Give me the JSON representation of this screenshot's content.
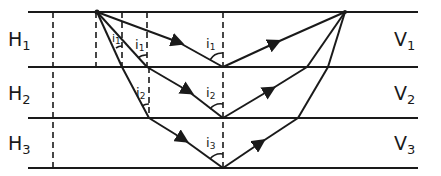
{
  "diagram": {
    "layers": [
      {
        "thickness_label": "H",
        "thickness_sub": "1",
        "velocity_label": "V",
        "velocity_sub": "1"
      },
      {
        "thickness_label": "H",
        "thickness_sub": "2",
        "velocity_label": "V",
        "velocity_sub": "2"
      },
      {
        "thickness_label": "H",
        "thickness_sub": "3",
        "velocity_label": "V",
        "velocity_sub": "3"
      }
    ],
    "angle_labels": [
      {
        "text": "i",
        "sub": "1",
        "note": "incidence angle at reflector 1"
      },
      {
        "text": "i",
        "sub": "2",
        "note": "incidence angle at reflector 2"
      },
      {
        "text": "i",
        "sub": "3",
        "note": "incidence angle at reflector 3"
      },
      {
        "text": "i",
        "sub": "1",
        "note": "refraction angle in layer 1, ray 2"
      },
      {
        "text": "i",
        "sub": "2",
        "note": "refraction angle in layer 2, ray 3"
      },
      {
        "text": "i",
        "sub": "1",
        "note": "refraction angle in layer 1, ray 3"
      }
    ],
    "colors": {
      "line": "#1a1a1a",
      "background": "#ffffff"
    }
  }
}
